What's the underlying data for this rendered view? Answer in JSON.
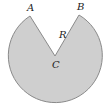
{
  "diagram": {
    "type": "circular-sector",
    "center": {
      "label": "C",
      "x": 55,
      "y": 56
    },
    "radius": 47,
    "points": [
      {
        "label": "A",
        "x": 30,
        "y": 16,
        "label_x": 28,
        "label_y": 11
      },
      {
        "label": "B",
        "x": 79,
        "y": 15,
        "label_x": 78,
        "label_y": 10
      }
    ],
    "radius_label": {
      "text": "R",
      "x": 60,
      "y": 38
    },
    "center_label": {
      "text": "C",
      "x": 54,
      "y": 68
    },
    "colors": {
      "fill": "#cfcfcf",
      "stroke": "#8a8a8a",
      "text": "#222222"
    }
  }
}
